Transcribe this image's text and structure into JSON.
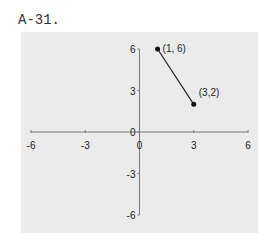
{
  "problem_label": "A-31.",
  "chart_data": {
    "type": "line",
    "title": "",
    "xlabel": "",
    "ylabel": "",
    "xlim": [
      -6,
      6
    ],
    "ylim": [
      -6,
      6
    ],
    "x_ticks": [
      -6,
      -3,
      0,
      3,
      6
    ],
    "y_ticks": [
      -6,
      -3,
      0,
      3,
      6
    ],
    "grid": false,
    "series": [
      {
        "name": "segment",
        "points": [
          [
            1,
            6
          ],
          [
            3,
            2
          ]
        ],
        "point_labels": [
          "(1, 6)",
          "(3,2)"
        ]
      }
    ]
  }
}
